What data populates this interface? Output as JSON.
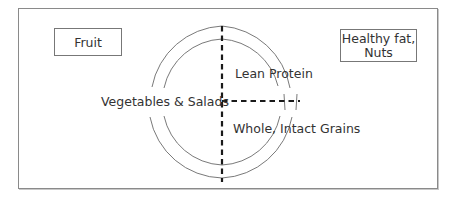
{
  "diagram": {
    "type": "healthy-eating-plate",
    "outside_items": [
      {
        "id": "fruit",
        "label": "Fruit"
      },
      {
        "id": "healthy-fat",
        "label": "Healthy fat,\nNuts",
        "line1": "Healthy fat,",
        "line2": "Nuts"
      }
    ],
    "plate_sections": [
      {
        "id": "vegetables",
        "label": "Vegetables & Salads",
        "position": "left half"
      },
      {
        "id": "protein",
        "label": "Lean Protein",
        "position": "upper right quarter"
      },
      {
        "id": "grains",
        "label": "Whole, Intact Grains",
        "position": "lower right quarter"
      }
    ],
    "colors": {
      "border": "#8a8a8a",
      "divider": "#1a1a1a",
      "arc": "#666666",
      "text": "#333333"
    }
  }
}
